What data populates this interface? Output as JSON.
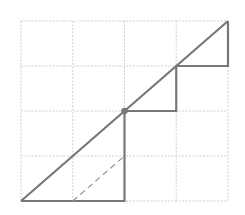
{
  "diagram": {
    "colors": {
      "background": "#ffffff",
      "grid": "#cfcfcf",
      "line": "#777777",
      "dashed": "#9a9a9a",
      "dot": "#777777"
    },
    "grid": {
      "x_lines": [
        21,
        72.75,
        124.5,
        176.25,
        228
      ],
      "y_lines": [
        21,
        66,
        111,
        156,
        201
      ]
    },
    "diagonal": {
      "x1": 21,
      "y1": 201,
      "x2": 228,
      "y2": 21
    },
    "staircase_points": "21,201 124.5,201 124.5,111 176.25,111 176.25,66 228,66 228,21",
    "dashed_segment": {
      "x1": 72.75,
      "y1": 201,
      "x2": 124.5,
      "y2": 156
    },
    "dot": {
      "cx": 124.5,
      "cy": 111,
      "r": 3.2
    }
  }
}
